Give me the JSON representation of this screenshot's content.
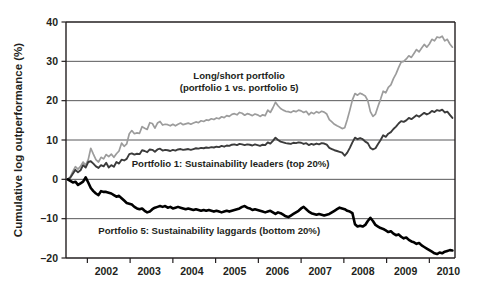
{
  "chart_data": {
    "type": "line",
    "title": "",
    "xlabel": "",
    "ylabel": "Cumulative log outperformance (%)",
    "ylim": [
      -20,
      40
    ],
    "xlim": [
      2001.5,
      2010.6
    ],
    "yticks": [
      -20,
      -10,
      0,
      10,
      20,
      30,
      40
    ],
    "ytick_labels": [
      "–20",
      "–10",
      "0",
      "10",
      "20",
      "30",
      "40"
    ],
    "xticks": [
      2002,
      2003,
      2004,
      2005,
      2006,
      2007,
      2008,
      2009,
      2010
    ],
    "xtick_labels": [
      "2002",
      "2003",
      "2004",
      "2005",
      "2006",
      "2007",
      "2008",
      "2009",
      "2010"
    ],
    "grid": "horizontal",
    "legend_position": "inline-annotations",
    "annotations": [
      {
        "name": "long-short-label",
        "lines": [
          "Long/short portfolio",
          "(portfolio 1 vs. portfolio 5)"
        ],
        "x": 2005.55,
        "y": 25.5
      },
      {
        "name": "portfolio1-label",
        "lines": [
          "Portfolio 1: Sustainability leaders (top 20%)"
        ],
        "x": 2005.35,
        "y": 3.2
      },
      {
        "name": "portfolio5-label",
        "lines": [
          "Portfolio 5: Sustainability laggards (bottom 20%)"
        ],
        "x": 2004.85,
        "y": -13.8
      }
    ],
    "series": [
      {
        "name": "Long/short portfolio (portfolio 1 vs. portfolio 5)",
        "color": "#9c9c9c",
        "width": 1.7,
        "x": [
          2001.54,
          2001.6,
          2001.66,
          2001.72,
          2001.78,
          2001.84,
          2001.9,
          2001.96,
          2002.02,
          2002.08,
          2002.14,
          2002.2,
          2002.26,
          2002.32,
          2002.38,
          2002.44,
          2002.5,
          2002.56,
          2002.62,
          2002.68,
          2002.74,
          2002.8,
          2002.86,
          2002.92,
          2002.98,
          2003.04,
          2003.1,
          2003.16,
          2003.22,
          2003.28,
          2003.34,
          2003.4,
          2003.46,
          2003.52,
          2003.58,
          2003.64,
          2003.7,
          2003.76,
          2003.82,
          2003.88,
          2003.94,
          2004.0,
          2004.06,
          2004.12,
          2004.18,
          2004.24,
          2004.3,
          2004.36,
          2004.42,
          2004.48,
          2004.54,
          2004.6,
          2004.66,
          2004.72,
          2004.78,
          2004.84,
          2004.9,
          2004.96,
          2005.02,
          2005.08,
          2005.14,
          2005.2,
          2005.26,
          2005.32,
          2005.38,
          2005.44,
          2005.5,
          2005.56,
          2005.62,
          2005.68,
          2005.74,
          2005.8,
          2005.86,
          2005.92,
          2005.98,
          2006.04,
          2006.1,
          2006.16,
          2006.22,
          2006.28,
          2006.34,
          2006.4,
          2006.46,
          2006.52,
          2006.58,
          2006.64,
          2006.7,
          2006.76,
          2006.82,
          2006.88,
          2006.94,
          2007.0,
          2007.06,
          2007.12,
          2007.18,
          2007.24,
          2007.3,
          2007.36,
          2007.42,
          2007.48,
          2007.54,
          2007.6,
          2007.66,
          2007.72,
          2007.78,
          2007.84,
          2007.9,
          2007.96,
          2008.02,
          2008.08,
          2008.14,
          2008.2,
          2008.26,
          2008.32,
          2008.38,
          2008.44,
          2008.5,
          2008.56,
          2008.62,
          2008.68,
          2008.74,
          2008.8,
          2008.86,
          2008.92,
          2008.98,
          2009.04,
          2009.1,
          2009.16,
          2009.22,
          2009.28,
          2009.34,
          2009.4,
          2009.46,
          2009.52,
          2009.58,
          2009.64,
          2009.7,
          2009.76,
          2009.82,
          2009.88,
          2009.94,
          2010.0,
          2010.06,
          2010.12,
          2010.18,
          2010.24,
          2010.3,
          2010.36,
          2010.42,
          2010.48,
          2010.54
        ],
        "y": [
          0.0,
          0.6,
          2.0,
          3.2,
          2.6,
          3.3,
          4.4,
          3.6,
          5.0,
          7.9,
          6.4,
          5.0,
          4.4,
          5.6,
          5.2,
          6.3,
          5.8,
          6.4,
          5.6,
          6.5,
          7.2,
          9.2,
          8.4,
          9.0,
          11.6,
          12.4,
          11.6,
          11.8,
          11.7,
          13.4,
          13.0,
          12.7,
          14.4,
          14.2,
          13.0,
          14.3,
          14.7,
          13.8,
          14.0,
          13.9,
          13.6,
          14.0,
          13.6,
          14.0,
          14.3,
          13.9,
          14.1,
          14.3,
          14.0,
          14.3,
          14.6,
          14.4,
          14.9,
          14.7,
          15.1,
          15.0,
          15.4,
          15.2,
          15.6,
          15.4,
          15.9,
          15.7,
          16.2,
          16.0,
          16.5,
          16.7,
          16.4,
          17.0,
          16.8,
          16.3,
          16.7,
          16.5,
          16.2,
          16.6,
          16.4,
          16.0,
          16.4,
          16.2,
          17.6,
          17.0,
          18.2,
          19.6,
          18.7,
          18.0,
          17.6,
          17.3,
          17.2,
          17.0,
          17.4,
          17.2,
          17.6,
          17.4,
          17.0,
          17.3,
          16.4,
          17.0,
          16.7,
          17.2,
          16.9,
          17.3,
          17.1,
          16.6,
          15.2,
          14.6,
          14.0,
          13.6,
          13.3,
          12.9,
          13.1,
          15.2,
          17.6,
          20.2,
          21.8,
          21.4,
          21.9,
          21.6,
          21.2,
          20.0,
          17.2,
          16.0,
          16.6,
          18.6,
          20.4,
          22.4,
          22.0,
          23.4,
          24.0,
          25.6,
          26.8,
          28.4,
          29.8,
          30.0,
          30.6,
          31.4,
          31.0,
          32.0,
          33.0,
          32.4,
          33.4,
          34.3,
          33.6,
          34.4,
          35.6,
          35.2,
          36.2,
          36.0,
          36.4,
          35.2,
          35.6,
          34.4,
          33.6
        ]
      },
      {
        "name": "Portfolio 1: Sustainability leaders (top 20%)",
        "color": "#3b3b3b",
        "width": 1.9,
        "x": [
          2001.54,
          2001.6,
          2001.66,
          2001.72,
          2001.78,
          2001.84,
          2001.9,
          2001.96,
          2002.02,
          2002.08,
          2002.14,
          2002.2,
          2002.26,
          2002.32,
          2002.38,
          2002.44,
          2002.5,
          2002.56,
          2002.62,
          2002.68,
          2002.74,
          2002.8,
          2002.86,
          2002.92,
          2002.98,
          2003.04,
          2003.1,
          2003.16,
          2003.22,
          2003.28,
          2003.34,
          2003.4,
          2003.46,
          2003.52,
          2003.58,
          2003.64,
          2003.7,
          2003.76,
          2003.82,
          2003.88,
          2003.94,
          2004.0,
          2004.06,
          2004.12,
          2004.18,
          2004.24,
          2004.3,
          2004.36,
          2004.42,
          2004.48,
          2004.54,
          2004.6,
          2004.66,
          2004.72,
          2004.78,
          2004.84,
          2004.9,
          2004.96,
          2005.02,
          2005.08,
          2005.14,
          2005.2,
          2005.26,
          2005.32,
          2005.38,
          2005.44,
          2005.5,
          2005.56,
          2005.62,
          2005.68,
          2005.74,
          2005.8,
          2005.86,
          2005.92,
          2005.98,
          2006.04,
          2006.1,
          2006.16,
          2006.22,
          2006.28,
          2006.34,
          2006.4,
          2006.46,
          2006.52,
          2006.58,
          2006.64,
          2006.7,
          2006.76,
          2006.82,
          2006.88,
          2006.94,
          2007.0,
          2007.06,
          2007.12,
          2007.18,
          2007.24,
          2007.3,
          2007.36,
          2007.42,
          2007.48,
          2007.54,
          2007.6,
          2007.66,
          2007.72,
          2007.78,
          2007.84,
          2007.9,
          2007.96,
          2008.02,
          2008.08,
          2008.14,
          2008.2,
          2008.26,
          2008.32,
          2008.38,
          2008.44,
          2008.5,
          2008.56,
          2008.62,
          2008.68,
          2008.74,
          2008.8,
          2008.86,
          2008.92,
          2008.98,
          2009.04,
          2009.1,
          2009.16,
          2009.22,
          2009.28,
          2009.34,
          2009.4,
          2009.46,
          2009.52,
          2009.58,
          2009.64,
          2009.7,
          2009.76,
          2009.82,
          2009.88,
          2009.94,
          2010.0,
          2010.06,
          2010.12,
          2010.18,
          2010.24,
          2010.3,
          2010.36,
          2010.42,
          2010.48,
          2010.54
        ],
        "y": [
          0.0,
          0.4,
          1.4,
          2.4,
          1.8,
          2.3,
          3.6,
          3.0,
          4.4,
          4.6,
          4.0,
          3.3,
          2.9,
          3.6,
          3.3,
          4.2,
          3.0,
          3.6,
          3.2,
          4.4,
          4.0,
          5.0,
          4.8,
          5.2,
          6.4,
          6.6,
          6.3,
          6.5,
          6.4,
          7.4,
          7.2,
          6.9,
          7.6,
          7.5,
          7.0,
          7.6,
          7.8,
          7.3,
          7.5,
          7.4,
          7.2,
          7.5,
          7.3,
          7.6,
          7.7,
          7.5,
          7.6,
          7.7,
          7.5,
          7.7,
          7.9,
          7.8,
          8.0,
          7.9,
          8.1,
          8.0,
          8.2,
          8.1,
          8.3,
          8.2,
          8.5,
          8.3,
          8.6,
          8.5,
          8.8,
          8.9,
          8.7,
          9.0,
          8.9,
          8.7,
          8.9,
          8.8,
          8.6,
          8.9,
          8.7,
          8.5,
          8.8,
          8.7,
          9.4,
          9.1,
          9.8,
          10.6,
          10.0,
          9.6,
          9.4,
          9.2,
          9.1,
          9.0,
          9.3,
          9.2,
          9.4,
          9.3,
          9.0,
          9.2,
          8.7,
          9.0,
          8.8,
          9.1,
          8.9,
          9.2,
          9.1,
          8.8,
          8.0,
          7.7,
          7.4,
          7.2,
          7.0,
          6.8,
          6.0,
          6.8,
          8.0,
          9.4,
          10.6,
          10.2,
          10.5,
          10.2,
          9.6,
          9.2,
          8.0,
          7.6,
          7.9,
          9.0,
          10.0,
          11.2,
          10.8,
          11.6,
          12.0,
          12.8,
          13.4,
          14.2,
          14.8,
          14.6,
          15.0,
          15.6,
          15.3,
          15.8,
          16.3,
          15.9,
          16.4,
          16.9,
          16.5,
          16.8,
          17.4,
          17.1,
          17.6,
          17.4,
          17.7,
          17.0,
          17.2,
          16.4,
          15.6
        ]
      },
      {
        "name": "Portfolio 5: Sustainability laggards (bottom 20%)",
        "color": "#000000",
        "width": 2.6,
        "x": [
          2001.54,
          2001.6,
          2001.66,
          2001.72,
          2001.78,
          2001.84,
          2001.9,
          2001.96,
          2002.02,
          2002.08,
          2002.14,
          2002.2,
          2002.26,
          2002.32,
          2002.38,
          2002.44,
          2002.5,
          2002.56,
          2002.62,
          2002.68,
          2002.74,
          2002.8,
          2002.86,
          2002.92,
          2002.98,
          2003.04,
          2003.1,
          2003.16,
          2003.22,
          2003.28,
          2003.34,
          2003.4,
          2003.46,
          2003.52,
          2003.58,
          2003.64,
          2003.7,
          2003.76,
          2003.82,
          2003.88,
          2003.94,
          2004.0,
          2004.06,
          2004.12,
          2004.18,
          2004.24,
          2004.3,
          2004.36,
          2004.42,
          2004.48,
          2004.54,
          2004.6,
          2004.66,
          2004.72,
          2004.78,
          2004.84,
          2004.9,
          2004.96,
          2005.02,
          2005.08,
          2005.14,
          2005.2,
          2005.26,
          2005.32,
          2005.38,
          2005.44,
          2005.5,
          2005.56,
          2005.62,
          2005.68,
          2005.74,
          2005.8,
          2005.86,
          2005.92,
          2005.98,
          2006.04,
          2006.1,
          2006.16,
          2006.22,
          2006.28,
          2006.34,
          2006.4,
          2006.46,
          2006.52,
          2006.58,
          2006.64,
          2006.7,
          2006.76,
          2006.82,
          2006.88,
          2006.94,
          2007.0,
          2007.06,
          2007.12,
          2007.18,
          2007.24,
          2007.3,
          2007.36,
          2007.42,
          2007.48,
          2007.54,
          2007.6,
          2007.66,
          2007.72,
          2007.78,
          2007.84,
          2007.9,
          2007.96,
          2008.02,
          2008.08,
          2008.14,
          2008.2,
          2008.26,
          2008.32,
          2008.38,
          2008.44,
          2008.5,
          2008.56,
          2008.62,
          2008.68,
          2008.74,
          2008.8,
          2008.86,
          2008.92,
          2008.98,
          2009.04,
          2009.1,
          2009.16,
          2009.22,
          2009.28,
          2009.34,
          2009.4,
          2009.46,
          2009.52,
          2009.58,
          2009.64,
          2009.7,
          2009.76,
          2009.82,
          2009.88,
          2009.94,
          2010.0,
          2010.06,
          2010.12,
          2010.18,
          2010.24,
          2010.3,
          2010.36,
          2010.42,
          2010.48,
          2010.54
        ],
        "y": [
          0.0,
          -0.4,
          -0.8,
          -0.6,
          -1.4,
          -1.0,
          -0.6,
          0.5,
          -0.8,
          -2.2,
          -3.0,
          -3.6,
          -4.0,
          -3.0,
          -3.2,
          -3.2,
          -3.4,
          -3.6,
          -4.0,
          -4.4,
          -4.2,
          -4.8,
          -5.4,
          -6.0,
          -6.2,
          -6.4,
          -7.0,
          -7.4,
          -7.6,
          -7.4,
          -8.0,
          -8.4,
          -8.2,
          -7.6,
          -7.2,
          -7.0,
          -6.8,
          -7.0,
          -6.8,
          -7.2,
          -7.0,
          -7.4,
          -7.2,
          -7.0,
          -7.2,
          -7.4,
          -7.6,
          -7.4,
          -7.6,
          -7.8,
          -7.6,
          -7.8,
          -8.0,
          -7.8,
          -8.0,
          -7.8,
          -8.0,
          -8.2,
          -8.0,
          -8.2,
          -8.4,
          -8.2,
          -8.0,
          -8.2,
          -8.0,
          -7.8,
          -7.6,
          -7.4,
          -7.0,
          -6.8,
          -7.2,
          -7.4,
          -7.8,
          -7.6,
          -7.8,
          -8.0,
          -8.2,
          -8.4,
          -8.2,
          -8.0,
          -8.4,
          -8.8,
          -8.4,
          -8.6,
          -9.0,
          -9.4,
          -9.6,
          -9.2,
          -8.8,
          -8.4,
          -8.0,
          -7.4,
          -7.0,
          -7.6,
          -8.2,
          -8.6,
          -8.8,
          -9.0,
          -8.8,
          -9.0,
          -9.2,
          -9.0,
          -8.8,
          -8.4,
          -8.0,
          -7.6,
          -7.2,
          -7.4,
          -7.6,
          -8.0,
          -8.2,
          -8.6,
          -11.4,
          -12.0,
          -11.8,
          -12.0,
          -11.6,
          -10.6,
          -9.8,
          -10.6,
          -11.6,
          -12.0,
          -12.4,
          -12.6,
          -13.0,
          -13.4,
          -13.2,
          -13.8,
          -14.2,
          -14.0,
          -14.6,
          -15.0,
          -14.8,
          -15.4,
          -15.8,
          -16.0,
          -16.4,
          -16.2,
          -16.8,
          -17.2,
          -17.6,
          -18.0,
          -18.4,
          -18.8,
          -19.0,
          -18.6,
          -18.8,
          -18.4,
          -18.2,
          -18.0,
          -18.1
        ]
      }
    ]
  }
}
